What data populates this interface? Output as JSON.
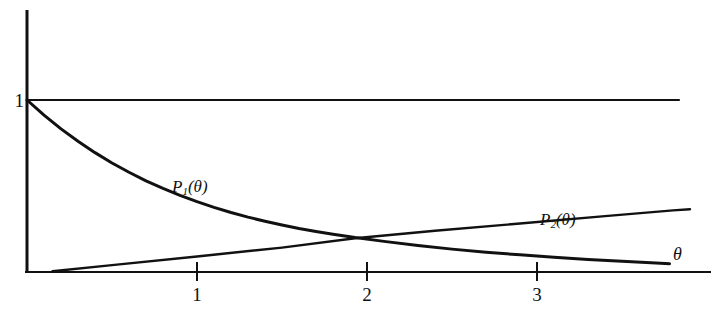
{
  "chart_data": {
    "type": "line",
    "title": "",
    "subtitle": "",
    "xlabel": "θ",
    "ylabel": "",
    "xlim": [
      0,
      4.02
    ],
    "ylim": [
      0,
      1.06
    ],
    "grid": false,
    "legend_position": "inline-annotations",
    "x_ticks": [
      {
        "value": 1,
        "label": "1"
      },
      {
        "value": 2,
        "label": "2"
      },
      {
        "value": 3,
        "label": "3"
      }
    ],
    "y_ticks": [
      {
        "value": 1,
        "label": "1"
      }
    ],
    "reference_lines": [
      {
        "name": "y-equals-one",
        "orientation": "horizontal",
        "value": 1,
        "from_x": 0,
        "to_x": 3.84
      }
    ],
    "annotations": [
      {
        "name": "p1-curve-label",
        "text": "P1(θ)",
        "base": "P",
        "sub": "1",
        "arg": "(θ)",
        "x": 0.9,
        "y": 0.4
      },
      {
        "name": "p2-curve-label",
        "text": "P2(θ)",
        "base": "P",
        "sub": "2",
        "arg": "(θ)",
        "x": 3.1,
        "y": 0.235
      },
      {
        "name": "theta-axis-label",
        "text": "θ",
        "x": 3.83,
        "y": 0.085
      }
    ],
    "series": [
      {
        "name": "P1(θ)",
        "label_base": "P",
        "label_sub": "1",
        "label_arg": "(θ)",
        "color": "#111111",
        "linewidth": 3.0,
        "x": [
          0.0,
          0.1,
          0.2,
          0.3,
          0.4,
          0.5,
          0.6,
          0.7,
          0.8,
          0.9,
          1.0,
          1.1,
          1.2,
          1.3,
          1.4,
          1.5,
          1.6,
          1.7,
          1.8,
          1.93,
          2.1,
          2.3,
          2.5,
          2.7,
          2.9,
          3.1,
          3.3,
          3.5,
          3.7,
          3.78
        ],
        "y": [
          1.0,
          0.912,
          0.832,
          0.76,
          0.694,
          0.634,
          0.58,
          0.53,
          0.486,
          0.446,
          0.409,
          0.376,
          0.346,
          0.319,
          0.295,
          0.273,
          0.253,
          0.236,
          0.22,
          0.2,
          0.178,
          0.154,
          0.133,
          0.115,
          0.1,
          0.086,
          0.073,
          0.062,
          0.052,
          0.048
        ]
      },
      {
        "name": "P2(θ)",
        "label_base": "P",
        "label_sub": "2",
        "label_arg": "(θ)",
        "color": "#111111",
        "linewidth": 2.4,
        "x": [
          0.15,
          0.5,
          1.0,
          1.5,
          1.93,
          2.4,
          2.9,
          3.4,
          3.8,
          3.9
        ],
        "y": [
          0.004,
          0.04,
          0.09,
          0.142,
          0.196,
          0.24,
          0.282,
          0.325,
          0.358,
          0.365
        ]
      }
    ]
  },
  "axes": {
    "x_axis_name": "horizontal-axis",
    "y_axis_name": "vertical-axis",
    "axis_color": "#111111"
  }
}
